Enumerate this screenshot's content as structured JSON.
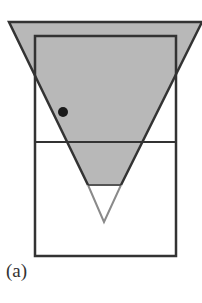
{
  "figure": {
    "label": "(a)",
    "colors": {
      "background": "#ffffff",
      "shade": "#b8b8b8",
      "stroke": "#333333",
      "light_stroke": "#8a8a8a",
      "dot": "#1a1a1a"
    },
    "elements": {
      "inverted_triangle": {
        "top_left": [
          9,
          22
        ],
        "top_right": [
          202,
          22
        ],
        "apex": [
          104,
          222
        ],
        "shaded_down_to_y": 185
      },
      "rectangle": {
        "x": 35,
        "y": 36,
        "width": 141,
        "height": 220
      },
      "divider_y": 142,
      "dot": {
        "cx": 63,
        "cy": 112,
        "r": 5
      }
    }
  }
}
